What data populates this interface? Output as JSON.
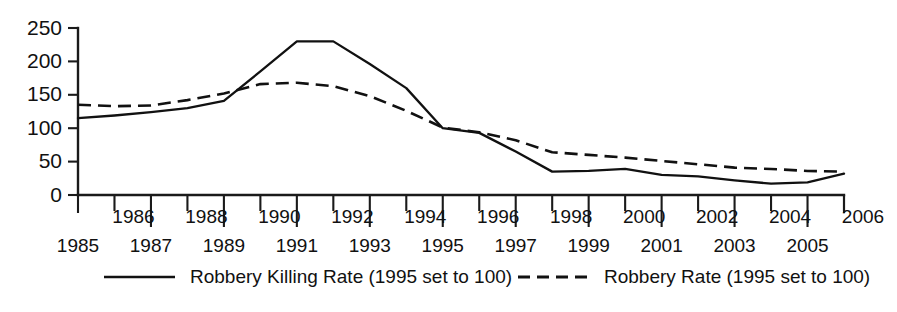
{
  "chart_data": {
    "type": "line",
    "title": "",
    "subtitle": "",
    "xlabel": "",
    "ylabel": "",
    "grid": false,
    "legend_position": "bottom",
    "xlim": [
      1985,
      2006
    ],
    "ylim": [
      0,
      250
    ],
    "ytick_values": [
      0,
      50,
      100,
      150,
      200,
      250
    ],
    "ytick_labels": [
      "0",
      "50",
      "100",
      "150",
      "200",
      "250"
    ],
    "x": [
      1985,
      1986,
      1987,
      1988,
      1989,
      1990,
      1991,
      1992,
      1993,
      1994,
      1995,
      1996,
      1997,
      1998,
      1999,
      2000,
      2001,
      2002,
      2003,
      2004,
      2005,
      2006
    ],
    "xtick_labels": [
      "1985",
      "1986",
      "1987",
      "1988",
      "1989",
      "1990",
      "1991",
      "1992",
      "1993",
      "1994",
      "1995",
      "1996",
      "1997",
      "1998",
      "1999",
      "2000",
      "2001",
      "2002",
      "2003",
      "2004",
      "2005",
      "2006"
    ],
    "series": [
      {
        "name": "Robbery Killing Rate (1995 set to 100)",
        "style": "solid",
        "color": "#111111",
        "values": [
          115,
          119,
          124,
          130,
          141,
          185,
          230,
          230,
          196,
          160,
          100,
          93,
          65,
          35,
          36,
          39,
          30,
          28,
          22,
          17,
          19,
          32
        ]
      },
      {
        "name": "Robbery Rate (1995 set to 100)",
        "style": "dashed",
        "color": "#111111",
        "values": [
          135,
          133,
          134,
          142,
          152,
          166,
          168,
          163,
          148,
          126,
          101,
          94,
          82,
          64,
          60,
          56,
          51,
          46,
          41,
          39,
          36,
          35
        ]
      }
    ]
  },
  "legend": {
    "entries": [
      {
        "label": "Robbery Killing Rate (1995 set to 100)",
        "style": "solid"
      },
      {
        "label": "Robbery Rate (1995 set to 100)",
        "style": "dashed"
      }
    ]
  }
}
